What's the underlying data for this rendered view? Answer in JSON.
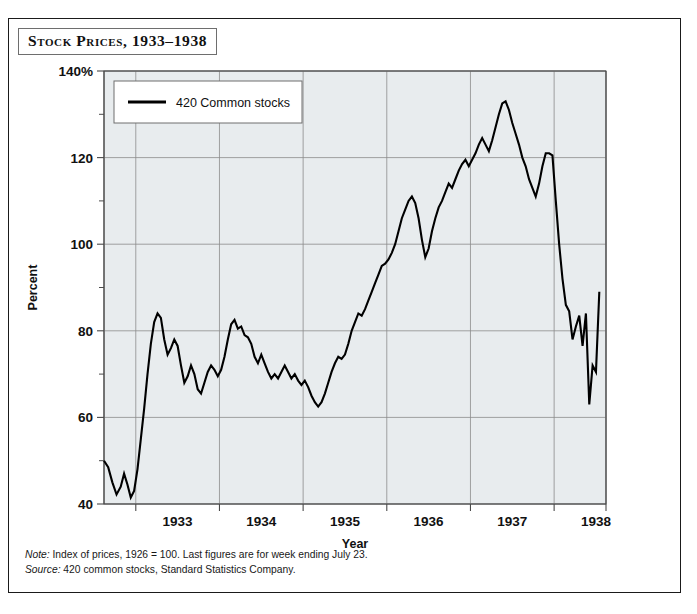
{
  "figure": {
    "title": "Stock Prices, 1933–1938",
    "notes": [
      {
        "label": "Note:",
        "text": " Index of prices, 1926 = 100. Last figures are for week ending July 23."
      },
      {
        "label": "Source:",
        "text": " 420 common stocks, Standard Statistics Company."
      }
    ],
    "colors": {
      "series": "#000000",
      "plot_background": "#e8ecee",
      "grid": "#8c8c8c",
      "frame": "#1a1a1a"
    }
  },
  "chart_data": {
    "type": "line",
    "title": "Stock Prices, 1933–1938",
    "xlabel": "Year",
    "ylabel": "Percent",
    "xlim": [
      1932.62,
      1938.62
    ],
    "ylim": [
      40,
      140
    ],
    "yticks": [
      40,
      60,
      80,
      100,
      120,
      140
    ],
    "yticklabels": [
      "40",
      "60",
      "80",
      "100",
      "120",
      "140%"
    ],
    "yticks_minor": [
      50,
      70,
      90,
      110,
      130
    ],
    "xticks": [
      1933,
      1934,
      1935,
      1936,
      1937,
      1938
    ],
    "xticklabels": [
      "1933",
      "1934",
      "1935",
      "1936",
      "1937",
      "1938"
    ],
    "xtick_label_offset_years": 0.5,
    "grid": true,
    "legend": {
      "position": "top-left-inside",
      "entries": [
        "420 Common stocks"
      ]
    },
    "series": [
      {
        "name": "420 Common stocks",
        "units": "Index, 1926 = 100",
        "x": [
          1932.62,
          1932.67,
          1932.72,
          1932.77,
          1932.82,
          1932.86,
          1932.9,
          1932.94,
          1932.98,
          1933.02,
          1933.06,
          1933.1,
          1933.14,
          1933.18,
          1933.22,
          1933.26,
          1933.3,
          1933.34,
          1933.38,
          1933.42,
          1933.46,
          1933.5,
          1933.54,
          1933.58,
          1933.62,
          1933.66,
          1933.7,
          1933.74,
          1933.78,
          1933.82,
          1933.86,
          1933.9,
          1933.94,
          1933.98,
          1934.02,
          1934.06,
          1934.1,
          1934.14,
          1934.18,
          1934.22,
          1934.26,
          1934.3,
          1934.34,
          1934.38,
          1934.42,
          1934.46,
          1934.5,
          1934.54,
          1934.58,
          1934.62,
          1934.66,
          1934.7,
          1934.74,
          1934.78,
          1934.82,
          1934.86,
          1934.9,
          1934.94,
          1934.98,
          1935.02,
          1935.06,
          1935.1,
          1935.14,
          1935.18,
          1935.22,
          1935.26,
          1935.3,
          1935.34,
          1935.38,
          1935.42,
          1935.46,
          1935.5,
          1935.54,
          1935.58,
          1935.62,
          1935.66,
          1935.7,
          1935.74,
          1935.78,
          1935.82,
          1935.86,
          1935.9,
          1935.94,
          1935.98,
          1936.02,
          1936.06,
          1936.1,
          1936.14,
          1936.18,
          1936.22,
          1936.26,
          1936.3,
          1936.34,
          1936.38,
          1936.42,
          1936.46,
          1936.5,
          1936.54,
          1936.58,
          1936.62,
          1936.66,
          1936.7,
          1936.74,
          1936.78,
          1936.82,
          1936.86,
          1936.9,
          1936.94,
          1936.98,
          1937.02,
          1937.06,
          1937.1,
          1937.14,
          1937.18,
          1937.22,
          1937.26,
          1937.3,
          1937.34,
          1937.38,
          1937.42,
          1937.46,
          1937.5,
          1937.54,
          1937.58,
          1937.62,
          1937.66,
          1937.7,
          1937.74,
          1937.78,
          1937.82,
          1937.86,
          1937.9,
          1937.94,
          1937.98,
          1938.02,
          1938.06,
          1938.1,
          1938.14,
          1938.18,
          1938.22,
          1938.26,
          1938.3,
          1938.34,
          1938.38,
          1938.42,
          1938.46,
          1938.5,
          1938.54
        ],
        "y": [
          50.0,
          48.5,
          45.0,
          42.2,
          44.0,
          47.0,
          44.5,
          41.5,
          43.0,
          48.0,
          55.0,
          62.0,
          70.0,
          77.0,
          82.0,
          84.0,
          83.0,
          78.0,
          74.5,
          76.0,
          78.0,
          76.5,
          72.0,
          68.0,
          69.5,
          72.0,
          70.0,
          66.5,
          65.5,
          68.0,
          70.5,
          72.0,
          71.0,
          69.5,
          71.0,
          74.0,
          78.0,
          81.5,
          82.5,
          80.5,
          81.0,
          79.0,
          78.5,
          77.0,
          74.0,
          72.5,
          74.5,
          72.5,
          70.5,
          69.0,
          70.0,
          69.0,
          70.5,
          72.0,
          70.5,
          69.0,
          70.0,
          68.5,
          67.5,
          68.5,
          67.0,
          65.0,
          63.5,
          62.5,
          63.5,
          65.5,
          68.0,
          70.5,
          72.5,
          74.0,
          73.5,
          74.5,
          77.0,
          80.0,
          82.0,
          84.0,
          83.5,
          85.0,
          87.0,
          89.0,
          91.0,
          93.0,
          95.0,
          95.5,
          96.5,
          98.0,
          100.0,
          103.0,
          106.0,
          108.0,
          110.0,
          111.0,
          109.5,
          106.0,
          101.0,
          97.0,
          99.0,
          103.0,
          106.0,
          108.5,
          110.0,
          112.0,
          114.0,
          113.0,
          115.0,
          117.0,
          118.5,
          119.5,
          118.0,
          119.5,
          121.0,
          123.0,
          124.5,
          123.0,
          121.5,
          124.0,
          127.0,
          130.0,
          132.5,
          133.0,
          131.0,
          128.0,
          125.5,
          123.0,
          120.0,
          118.0,
          115.0,
          113.0,
          111.0,
          114.0,
          118.0,
          121.0,
          121.0,
          120.5,
          110.0,
          100.0,
          92.0,
          86.0,
          84.5,
          78.0,
          81.0,
          83.5,
          76.5,
          84.0,
          63.0,
          72.0,
          70.5,
          89.0
        ],
        "peak": {
          "value": 133.0,
          "x": 1937.42
        },
        "trough_start": {
          "value": 41.5,
          "x": 1932.94
        },
        "last_value": 89.0
      }
    ]
  }
}
